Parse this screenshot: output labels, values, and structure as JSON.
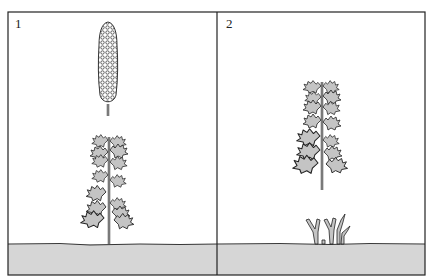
{
  "figure": {
    "panels": [
      {
        "number": "1",
        "description": "Mature plant with tall flower spike (inflorescence) detached above a leafy stem",
        "elements": [
          "flower-spike",
          "leafy-stem",
          "ground"
        ]
      },
      {
        "number": "2",
        "description": "Leafy stem detached above ground with new shoots sprouting from ground",
        "elements": [
          "leafy-stem",
          "new-shoots",
          "ground"
        ]
      }
    ],
    "colors": {
      "background": "#ffffff",
      "line": "#222222",
      "ground": "#d6d6d6",
      "leaf_fill": "#c4c4c4"
    }
  }
}
